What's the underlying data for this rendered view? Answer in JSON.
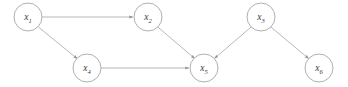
{
  "figure": {
    "type": "directed-acyclic-graph",
    "background_color": "#ffffff",
    "node_stroke_color": "#9a9a9a",
    "edge_stroke_color": "#9a9a9a",
    "label_color": "#3a3a3a",
    "node_radius": 14
  },
  "nodes": [
    {
      "id": "x1",
      "var": "x",
      "subscript": "1",
      "label": "x1",
      "cx": 28,
      "cy": 17
    },
    {
      "id": "x2",
      "var": "x",
      "subscript": "2",
      "label": "x2",
      "cx": 148,
      "cy": 17
    },
    {
      "id": "x3",
      "var": "x",
      "subscript": "3",
      "label": "x3",
      "cx": 261,
      "cy": 17
    },
    {
      "id": "x4",
      "var": "x",
      "subscript": "4",
      "label": "x4",
      "cx": 87,
      "cy": 68
    },
    {
      "id": "x5",
      "var": "x",
      "subscript": "5",
      "label": "x5",
      "cx": 204,
      "cy": 68
    },
    {
      "id": "x6",
      "var": "x",
      "subscript": "6",
      "label": "x6",
      "cx": 319,
      "cy": 68
    }
  ],
  "edges": [
    {
      "from": "x1",
      "to": "x2",
      "x1": 42.0,
      "y1": 17.0,
      "x2": 133.0,
      "y2": 17.0
    },
    {
      "from": "x1",
      "to": "x4",
      "x1": 38.4,
      "y1": 27.0,
      "x2": 77.4,
      "y2": 58.8
    },
    {
      "from": "x2",
      "to": "x5",
      "x1": 157.8,
      "y1": 27.0,
      "x2": 194.8,
      "y2": 58.6
    },
    {
      "from": "x4",
      "to": "x5",
      "x1": 101.0,
      "y1": 68.0,
      "x2": 189.0,
      "y2": 68.0
    },
    {
      "from": "x3",
      "to": "x5",
      "x1": 251.0,
      "y1": 27.1,
      "x2": 214.4,
      "y2": 58.5
    },
    {
      "from": "x3",
      "to": "x6",
      "x1": 271.0,
      "y1": 27.1,
      "x2": 308.8,
      "y2": 58.7
    }
  ]
}
